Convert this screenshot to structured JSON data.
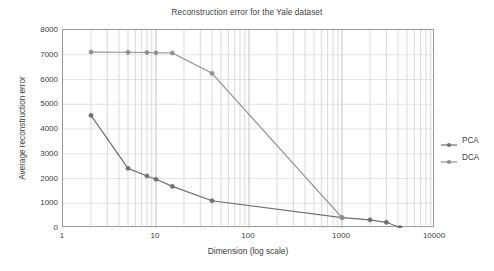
{
  "chart_data": {
    "type": "line",
    "title": "Reconstruction error for the Yale dataset",
    "xlabel": "Dimension (log scale)",
    "ylabel": "Average reconstruction error",
    "xscale": "log",
    "yscale": "linear",
    "xlim": [
      1,
      10000
    ],
    "ylim": [
      0,
      8000
    ],
    "grid": true,
    "grid_minor": true,
    "legend_position": "right-outside",
    "xticks": [
      1,
      10,
      100,
      1000,
      10000
    ],
    "xtick_labels": [
      "1",
      "10",
      "100",
      "1000",
      "10000"
    ],
    "yticks": [
      0,
      1000,
      2000,
      3000,
      4000,
      5000,
      6000,
      7000,
      8000
    ],
    "ytick_labels": [
      "0",
      "1000",
      "2000",
      "3000",
      "4000",
      "5000",
      "6000",
      "7000",
      "8000"
    ],
    "series": [
      {
        "name": "PCA",
        "color": "#6f6f6f",
        "marker": "circle",
        "x": [
          2,
          5,
          8,
          10,
          15,
          40,
          1000,
          2000,
          3000,
          4200
        ],
        "y": [
          4550,
          2410,
          2100,
          1970,
          1680,
          1100,
          420,
          330,
          230,
          20
        ]
      },
      {
        "name": "DCA",
        "color": "#8f8f8f",
        "marker": "circle",
        "x": [
          2,
          5,
          8,
          10,
          15,
          40,
          1000
        ],
        "y": [
          7110,
          7100,
          7090,
          7080,
          7070,
          6250,
          420
        ]
      }
    ]
  },
  "legend": {
    "items": [
      {
        "label": "PCA",
        "color": "#6f6f6f"
      },
      {
        "label": "DCA",
        "color": "#8f8f8f"
      }
    ]
  }
}
